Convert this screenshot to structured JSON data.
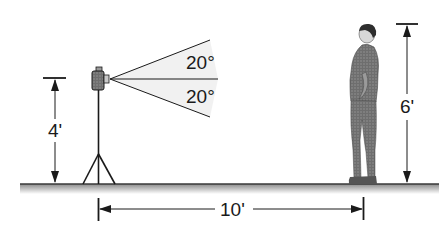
{
  "diagram": {
    "type": "camera-field-of-view",
    "colors": {
      "line": "#1a1a1a",
      "ground": "#8a8a8a",
      "cone_fill": "#f1f1f1",
      "person": "#6b6b6b",
      "background": "#ffffff"
    },
    "camera": {
      "height_label": "4'",
      "upper_angle_label": "20°",
      "lower_angle_label": "20°"
    },
    "person": {
      "height_label": "6'"
    },
    "distance": {
      "label": "10'"
    }
  }
}
